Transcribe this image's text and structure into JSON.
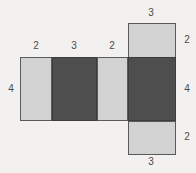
{
  "figure": {
    "name": "net-of-rectangular-prism",
    "background_color": "#f3f1ef",
    "light_face_color": "#d2d2d2",
    "dark_face_color": "#4e4e4e",
    "outline_color": "#5a5a5a",
    "label_color": "#4a4a4a"
  },
  "faces": [
    {
      "id": "top-flap",
      "shade": "light",
      "x": 128,
      "y": 23,
      "w": 48,
      "h": 35
    },
    {
      "id": "row-face-1",
      "shade": "light",
      "x": 20,
      "y": 57,
      "w": 32,
      "h": 64
    },
    {
      "id": "row-face-2",
      "shade": "dark",
      "x": 52,
      "y": 57,
      "w": 45,
      "h": 64
    },
    {
      "id": "row-face-3",
      "shade": "light",
      "x": 97,
      "y": 57,
      "w": 31,
      "h": 64
    },
    {
      "id": "row-face-4",
      "shade": "dark",
      "x": 128,
      "y": 57,
      "w": 48,
      "h": 64
    },
    {
      "id": "bottom-flap",
      "shade": "light",
      "x": 128,
      "y": 121,
      "w": 48,
      "h": 34
    }
  ],
  "labels": [
    {
      "id": "label-top-flap-width",
      "value": "3",
      "x": 143,
      "y": 8
    },
    {
      "id": "label-face1-width",
      "value": "2",
      "x": 28,
      "y": 41
    },
    {
      "id": "label-face2-width",
      "value": "3",
      "x": 66,
      "y": 41
    },
    {
      "id": "label-face3-width",
      "value": "2",
      "x": 104,
      "y": 41
    },
    {
      "id": "label-left-height",
      "value": "4",
      "x": 3,
      "y": 84
    },
    {
      "id": "label-top-flap-height",
      "value": "2",
      "x": 179,
      "y": 35
    },
    {
      "id": "label-right-height",
      "value": "4",
      "x": 179,
      "y": 84
    },
    {
      "id": "label-bottom-flap-height",
      "value": "2",
      "x": 179,
      "y": 132
    },
    {
      "id": "label-bottom-flap-width",
      "value": "3",
      "x": 143,
      "y": 157
    }
  ]
}
